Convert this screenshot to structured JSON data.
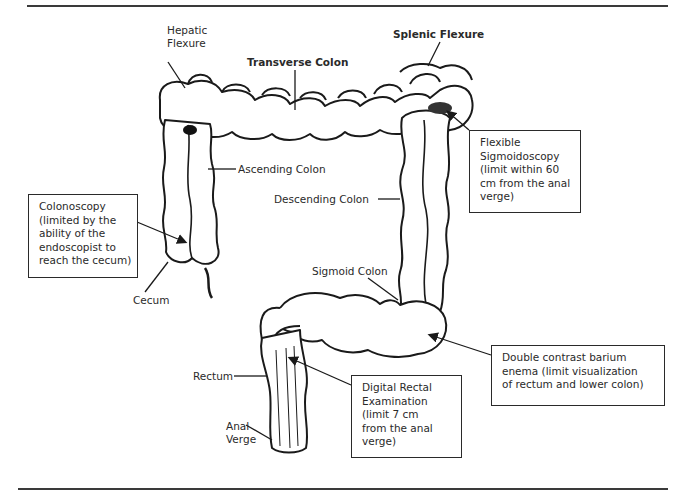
{
  "figure": {
    "colors": {
      "ink": "#2a2a2a",
      "background": "#ffffff",
      "rule": "#3a3a3a"
    }
  },
  "anatomy_labels": {
    "hepatic_flexure": [
      "Hepatic",
      "Flexure"
    ],
    "transverse_colon": "Transverse Colon",
    "splenic_flexure": "Splenic Flexure",
    "ascending_colon": "Ascending Colon",
    "descending_colon": "Descending Colon",
    "sigmoid_colon": "Sigmoid Colon",
    "cecum": "Cecum",
    "rectum": "Rectum",
    "anal_verge": [
      "Anal",
      "Verge"
    ]
  },
  "callouts": {
    "colonoscopy": [
      "Colonoscopy",
      "(limited by the",
      "ability of the",
      "endoscopist to",
      "reach the cecum)"
    ],
    "flexible_sigmoidoscopy": [
      "Flexible",
      "Sigmoidoscopy",
      "(limit within 60",
      "cm from the anal",
      "verge)"
    ],
    "double_contrast": [
      "Double contrast barium",
      "enema (limit visualization",
      "of rectum and lower colon)"
    ],
    "digital_rectal": [
      "Digital Rectal",
      "Examination",
      "(limit 7 cm",
      "from the anal",
      "verge)"
    ]
  }
}
